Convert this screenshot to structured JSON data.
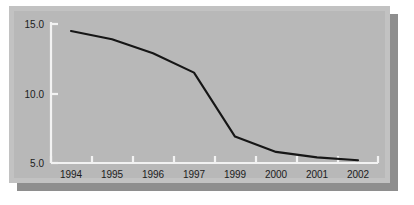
{
  "chart_data": {
    "type": "line",
    "title": "",
    "xlabel": "",
    "ylabel": "",
    "categories": [
      "1994",
      "1995",
      "1996",
      "1997",
      "1999",
      "2000",
      "2001",
      "2002"
    ],
    "x": [
      1994,
      1995,
      1996,
      1997,
      1999,
      2000,
      2001,
      2002
    ],
    "values": [
      14.5,
      13.9,
      12.9,
      11.5,
      6.9,
      5.8,
      5.4,
      5.2
    ],
    "series": [
      {
        "name": "series-1",
        "values": [
          14.5,
          13.9,
          12.9,
          11.5,
          6.9,
          5.8,
          5.4,
          5.2
        ]
      }
    ],
    "xtick_labels": [
      "1994",
      "1995",
      "1996",
      "1997",
      "1999",
      "2000",
      "2001",
      "2002"
    ],
    "ytick_labels": [
      "5.0",
      "10.0",
      "15.0"
    ],
    "yticks": [
      5.0,
      10.0,
      15.0
    ],
    "ylim": [
      5.0,
      15.0
    ],
    "grid": false,
    "legend": false,
    "line_color": "#161616",
    "axis_color": "#f2f2f2",
    "panel_color": "#b8b8b8",
    "frame_color": "#c2c2c2",
    "shadow_color": "#8e8e8e"
  }
}
